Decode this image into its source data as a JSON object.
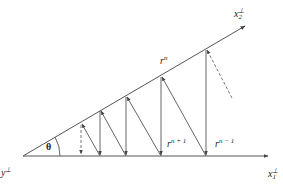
{
  "diagram": {
    "labels": {
      "origin": {
        "base": "y",
        "sup": "⊥"
      },
      "horizontal_axis": {
        "base": "x",
        "sub": "1",
        "sup": "⊥"
      },
      "slanted_axis": {
        "base": "x",
        "sub": "2",
        "sup": "⊥"
      },
      "angle": "θ",
      "r_n": {
        "base": "r",
        "sup": "n"
      },
      "r_n_plus_1": {
        "base": "r",
        "sup": "n + 1"
      },
      "r_n_minus_1": {
        "base": "r",
        "sup": "n − 1"
      }
    },
    "colors": {
      "line": "#555555",
      "background": "#ffffff"
    }
  }
}
